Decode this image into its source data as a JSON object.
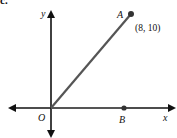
{
  "figure": {
    "part_label": "c.",
    "axes": {
      "x_label": "x",
      "y_label": "y",
      "origin_label": "O"
    },
    "points": {
      "A": {
        "label": "A",
        "coord_text": "(8, 10)"
      },
      "B": {
        "label": "B"
      }
    },
    "colors": {
      "axis": "#111111",
      "segment": "#555555",
      "point": "#333333"
    }
  }
}
